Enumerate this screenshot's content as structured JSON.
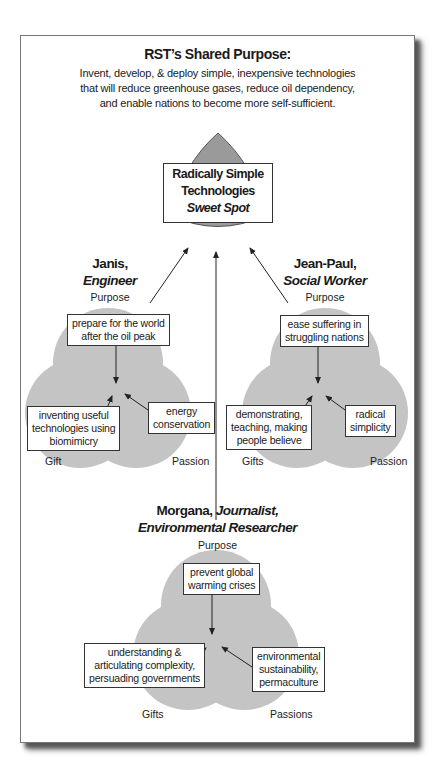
{
  "header": {
    "title": "RST’s Shared Purpose:",
    "subtitle_lines": [
      "Invent, develop, & deploy simple, inexpensive technologies",
      "that will reduce greenhouse gases, reduce oil dependency,",
      "and enable nations to become more self-sufficient."
    ]
  },
  "sweet_spot": {
    "line1": "Radically Simple",
    "line2": "Technologies",
    "line3": "Sweet Spot",
    "fill_color": "#9a9a9a"
  },
  "people": [
    {
      "name": "Janis,",
      "role": "Engineer",
      "top_label": "Purpose",
      "left_label": "Gift",
      "right_label": "Passion",
      "purpose_box": [
        "prepare for the world",
        "after the oil peak"
      ],
      "gift_box": [
        "inventing useful",
        "technologies using",
        "biomimicry"
      ],
      "passion_box": [
        "energy",
        "conservation"
      ]
    },
    {
      "name": "Jean-Paul,",
      "role": "Social Worker",
      "top_label": "Purpose",
      "left_label": "Gifts",
      "right_label": "Passion",
      "purpose_box": [
        "ease suffering in",
        "struggling nations"
      ],
      "gift_box": [
        "demonstrating,",
        "teaching, making",
        "people believe"
      ],
      "passion_box": [
        "radical",
        "simplicity"
      ]
    },
    {
      "name": "Morgana,",
      "role": "Journalist,",
      "role2": "Environmental Researcher",
      "top_label": "Purpose",
      "left_label": "Gifts",
      "right_label": "Passions",
      "purpose_box": [
        "prevent global",
        "warming crises"
      ],
      "gift_box": [
        "understanding &",
        "articulating complexity,",
        "persuading governments"
      ],
      "passion_box": [
        "environmental",
        "sustainability,",
        "permaculture"
      ]
    }
  ],
  "colors": {
    "circle_fill": "#bdbdbd",
    "frame_border": "#777777",
    "arrow": "#222222"
  }
}
